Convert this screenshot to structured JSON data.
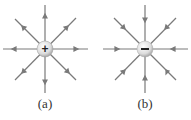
{
  "diagrams": [
    {
      "id": "a",
      "label": "(a)",
      "charge_symbol": "+",
      "charge": "positive",
      "field_direction": "outward",
      "center": [
        45,
        49
      ]
    },
    {
      "id": "b",
      "label": "(b)",
      "charge_symbol": "−",
      "charge": "negative",
      "field_direction": "inward",
      "center": [
        145,
        49
      ]
    }
  ],
  "colors": {
    "line": "#7a7a7a",
    "charge_fill": "#e4e4e4",
    "symbol": "#222222"
  }
}
